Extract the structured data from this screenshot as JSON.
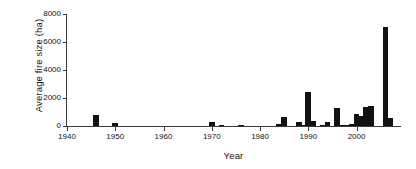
{
  "chart_data": {
    "type": "bar",
    "title": "",
    "xlabel": "Year",
    "ylabel": "Average fire size (ha)",
    "xlim": [
      1940,
      2009
    ],
    "ylim": [
      0,
      8000
    ],
    "grid": false,
    "legend": "none",
    "xticks": [
      1940,
      1950,
      1960,
      1970,
      1980,
      1990,
      2000
    ],
    "yticks": [
      0,
      2000,
      4000,
      6000,
      8000
    ],
    "categories": [
      1946,
      1950,
      1970,
      1972,
      1976,
      1984,
      1985,
      1988,
      1989,
      1990,
      1991,
      1993,
      1994,
      1996,
      1997,
      1998,
      1999,
      2000,
      2001,
      2002,
      2003,
      2006,
      2007
    ],
    "values": [
      760,
      200,
      320,
      50,
      30,
      150,
      640,
      260,
      90,
      2400,
      370,
      40,
      260,
      1260,
      70,
      60,
      110,
      880,
      720,
      1330,
      1440,
      7080,
      580
    ],
    "bar_color": "#121212",
    "bar_width_years": 1.2
  }
}
